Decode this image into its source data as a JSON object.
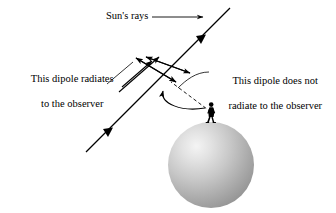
{
  "figure": {
    "title_text": "Sun's rays",
    "labels": {
      "suns_rays": "Sun's rays",
      "dipole_radiates_line1": "This dipole radiates",
      "dipole_radiates_line2": "to the observer",
      "dipole_not_radiates_line1": "This dipole does not",
      "dipole_not_radiates_line2": "radiate to the observer"
    },
    "colors": {
      "stroke": "#000000",
      "background": "#ffffff",
      "sphere_light": "#f2f2f2",
      "sphere_mid": "#b9b9b9",
      "sphere_dark": "#8e8e8e",
      "observer": "#000000"
    },
    "elements": {
      "sphere_name": "earth-sphere",
      "observer_name": "observer-figure",
      "ray_name": "suns-ray-line",
      "dipole_a_name": "dipole-radiating",
      "dipole_b_name": "dipole-non-radiating",
      "dashed_name": "line-of-sight-dashed",
      "curved_name": "curved-arrow-to-dipole"
    }
  }
}
